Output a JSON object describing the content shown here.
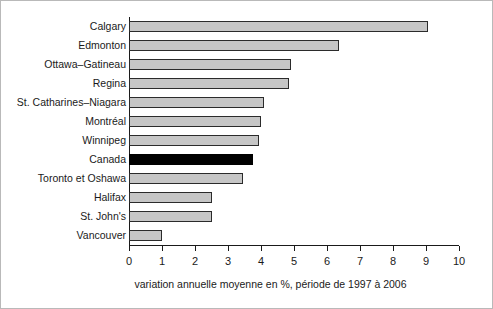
{
  "chart_data": {
    "type": "bar",
    "orientation": "horizontal",
    "title": "",
    "subtitle": "",
    "xlabel": "variation annuelle moyenne en %, période de 1997 à  2006",
    "ylabel": "",
    "xlim": [
      0,
      10
    ],
    "xticks": [
      0,
      1,
      2,
      3,
      4,
      5,
      6,
      7,
      8,
      9,
      10
    ],
    "xtick_labels": [
      "0",
      "1",
      "2",
      "3",
      "4",
      "5",
      "6",
      "7",
      "8",
      "9",
      "10"
    ],
    "grid": false,
    "legend": false,
    "highlight_category": "Canada",
    "colors": {
      "bar_fill": "#c6c6c6",
      "bar_edge": "#2b2b2b",
      "highlight_fill": "#000000",
      "axis": "#1a1a1a",
      "text": "#1a1a1a",
      "background": "#ffffff",
      "frame": "#b9b9b9"
    },
    "categories": [
      "Calgary",
      "Edmonton",
      "Ottawa–Gatineau",
      "Regina",
      "St. Catharines–Niagara",
      "Montréal",
      "Winnipeg",
      "Canada",
      "Toronto et Oshawa",
      "Halifax",
      "St. John's",
      "Vancouver"
    ],
    "values": [
      9.05,
      6.35,
      4.9,
      4.85,
      4.1,
      4.0,
      3.95,
      3.75,
      3.45,
      2.5,
      2.5,
      1.0
    ],
    "bars": [
      {
        "label": "Calgary",
        "value": 9.05,
        "highlight": false
      },
      {
        "label": "Edmonton",
        "value": 6.35,
        "highlight": false
      },
      {
        "label": "Ottawa–Gatineau",
        "value": 4.9,
        "highlight": false
      },
      {
        "label": "Regina",
        "value": 4.85,
        "highlight": false
      },
      {
        "label": "St. Catharines–Niagara",
        "value": 4.1,
        "highlight": false
      },
      {
        "label": "Montréal",
        "value": 4.0,
        "highlight": false
      },
      {
        "label": "Winnipeg",
        "value": 3.95,
        "highlight": false
      },
      {
        "label": "Canada",
        "value": 3.75,
        "highlight": true
      },
      {
        "label": "Toronto et Oshawa",
        "value": 3.45,
        "highlight": false
      },
      {
        "label": "Halifax",
        "value": 2.5,
        "highlight": false
      },
      {
        "label": "St. John's",
        "value": 2.5,
        "highlight": false
      },
      {
        "label": "Vancouver",
        "value": 1.0,
        "highlight": false
      }
    ]
  }
}
